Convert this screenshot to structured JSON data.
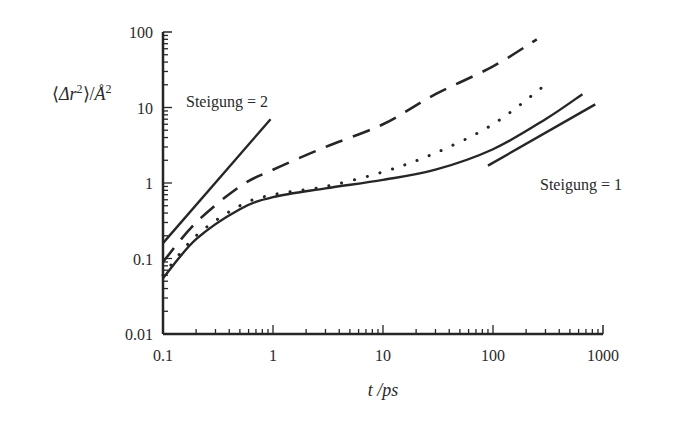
{
  "chart_data": {
    "type": "line",
    "title": "",
    "xlabel": "t /ps",
    "ylabel": "⟨Δr²⟩/Å²",
    "xscale": "log",
    "yscale": "log",
    "xlim": [
      0.1,
      1000
    ],
    "ylim": [
      0.01,
      100
    ],
    "x_ticks": [
      "0.1",
      "1",
      "10",
      "100",
      "1000"
    ],
    "y_ticks": [
      "0.01",
      "0.1",
      "1",
      "10",
      "100"
    ],
    "grid": false,
    "legend": null,
    "series": [
      {
        "name": "dashed curve",
        "style": "dashed",
        "x": [
          0.1,
          0.2,
          0.5,
          1,
          3,
          10,
          30,
          100,
          250
        ],
        "y": [
          0.09,
          0.3,
          0.9,
          1.5,
          3,
          6,
          15,
          35,
          80
        ]
      },
      {
        "name": "dotted curve",
        "style": "dotted",
        "x": [
          0.1,
          0.2,
          0.5,
          1,
          3,
          10,
          30,
          100,
          300
        ],
        "y": [
          0.06,
          0.2,
          0.5,
          0.7,
          0.9,
          1.4,
          2.5,
          6,
          20
        ]
      },
      {
        "name": "solid curve",
        "style": "solid",
        "x": [
          0.1,
          0.2,
          0.5,
          1,
          3,
          10,
          30,
          100,
          300,
          650
        ],
        "y": [
          0.055,
          0.18,
          0.45,
          0.65,
          0.85,
          1.1,
          1.5,
          2.8,
          7,
          15
        ]
      },
      {
        "name": "reference slope 2",
        "style": "solid",
        "x": [
          0.1,
          0.95
        ],
        "y": [
          0.16,
          7
        ]
      },
      {
        "name": "reference slope 1",
        "style": "solid",
        "x": [
          90,
          850
        ],
        "y": [
          1.7,
          11
        ]
      }
    ],
    "annotations": [
      {
        "text": "Steigung = 2",
        "x": 0.17,
        "y": 12
      },
      {
        "text": "Steigung = 1",
        "x": 150,
        "y": 0.85
      }
    ]
  },
  "labels": {
    "ylabel": "⟨Δr²⟩/Å²",
    "xlabel": "t /ps",
    "slope2": "Steigung = 2",
    "slope1": "Steigung = 1"
  }
}
